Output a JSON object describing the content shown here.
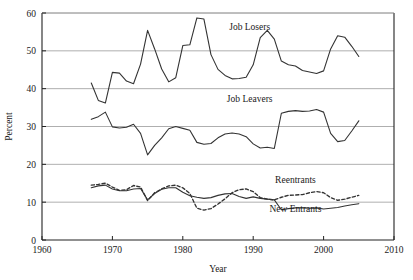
{
  "chart_data": {
    "type": "line",
    "title": "",
    "xlabel": "Year",
    "ylabel": "Percent",
    "xlim": [
      1960,
      2010
    ],
    "ylim": [
      0,
      60
    ],
    "xticks": [
      1960,
      1970,
      1980,
      1990,
      2000,
      2010
    ],
    "yticks": [
      0,
      10,
      20,
      30,
      40,
      50,
      60
    ],
    "grid": "horizontal",
    "legend_position": "inline-annotations",
    "colors": {
      "line": "#333333",
      "grid": "#9a9a9a",
      "axis": "#222222"
    },
    "series": [
      {
        "name": "Job Losers",
        "style": "solid",
        "label_x": 1989.5,
        "label_y": 55.5,
        "x": [
          1967,
          1968,
          1969,
          1970,
          1971,
          1972,
          1973,
          1974,
          1975,
          1976,
          1977,
          1978,
          1979,
          1980,
          1981,
          1982,
          1983,
          1984,
          1985,
          1986,
          1987,
          1988,
          1989,
          1990,
          1991,
          1992,
          1993,
          1994,
          1995,
          1996,
          1997,
          1998,
          1999,
          2000,
          2001,
          2002,
          2003,
          2004,
          2005
        ],
        "y": [
          41.5,
          36.9,
          36.2,
          44.3,
          44.1,
          42.0,
          41.3,
          46.5,
          55.4,
          50.5,
          45.2,
          41.8,
          42.9,
          51.4,
          51.6,
          58.7,
          58.4,
          49.0,
          45.1,
          43.5,
          42.6,
          42.7,
          43.0,
          46.3,
          53.5,
          55.4,
          53.1,
          47.3,
          46.3,
          46.0,
          44.8,
          44.4,
          44.0,
          44.7,
          50.5,
          54.0,
          53.6,
          51.2,
          48.5
        ]
      },
      {
        "name": "Job Leavers",
        "style": "solid",
        "label_x": 1989.5,
        "label_y": 36.5,
        "x": [
          1967,
          1968,
          1969,
          1970,
          1971,
          1972,
          1973,
          1974,
          1975,
          1976,
          1977,
          1978,
          1979,
          1980,
          1981,
          1982,
          1983,
          1984,
          1985,
          1986,
          1987,
          1988,
          1989,
          1990,
          1991,
          1992,
          1993,
          1994,
          1995,
          1996,
          1997,
          1998,
          1999,
          2000,
          2001,
          2002,
          2003,
          2004,
          2005
        ],
        "y": [
          31.9,
          32.6,
          33.8,
          29.9,
          29.6,
          29.8,
          30.6,
          28.2,
          22.5,
          25.0,
          27.0,
          29.4,
          30.0,
          29.5,
          29.0,
          25.8,
          25.3,
          25.5,
          27.0,
          28.0,
          28.3,
          28.0,
          27.3,
          25.4,
          24.3,
          24.5,
          24.2,
          33.5,
          34.0,
          34.2,
          34.0,
          34.1,
          34.5,
          33.8,
          28.2,
          26.0,
          26.3,
          28.8,
          31.5
        ]
      },
      {
        "name": "Reentrants",
        "style": "dashed",
        "label_x": 1996.0,
        "label_y": 15.0,
        "x": [
          1967,
          1968,
          1969,
          1970,
          1971,
          1972,
          1973,
          1974,
          1975,
          1976,
          1977,
          1978,
          1979,
          1980,
          1981,
          1982,
          1983,
          1984,
          1985,
          1986,
          1987,
          1988,
          1989,
          1990,
          1991,
          1992,
          1993,
          1994,
          1995,
          1996,
          1997,
          1998,
          1999,
          2000,
          2001,
          2002,
          2003,
          2004,
          2005
        ],
        "y": [
          14.5,
          14.7,
          15.0,
          14.0,
          13.1,
          13.3,
          14.4,
          14.0,
          10.4,
          12.5,
          13.5,
          14.3,
          14.5,
          13.8,
          12.3,
          8.4,
          7.9,
          8.3,
          9.5,
          10.9,
          12.5,
          13.3,
          13.5,
          12.8,
          11.2,
          10.8,
          10.6,
          11.3,
          11.8,
          11.9,
          12.0,
          12.5,
          12.8,
          12.5,
          11.2,
          10.5,
          10.8,
          11.3,
          11.8
        ]
      },
      {
        "name": "New Entrants",
        "style": "solid",
        "label_x": 1996.0,
        "label_y": 7.5,
        "x": [
          1967,
          1968,
          1969,
          1970,
          1971,
          1972,
          1973,
          1974,
          1975,
          1976,
          1977,
          1978,
          1979,
          1980,
          1981,
          1982,
          1983,
          1984,
          1985,
          1986,
          1987,
          1988,
          1989,
          1990,
          1991,
          1992,
          1993,
          1994,
          1995,
          1996,
          1997,
          1998,
          1999,
          2000,
          2001,
          2002,
          2003,
          2004,
          2005
        ],
        "y": [
          13.8,
          14.3,
          14.5,
          13.5,
          13.0,
          13.0,
          13.5,
          13.6,
          10.6,
          12.3,
          13.4,
          13.8,
          13.8,
          12.6,
          11.7,
          11.3,
          11.0,
          11.2,
          11.8,
          12.2,
          12.3,
          11.5,
          11.0,
          11.4,
          11.0,
          10.8,
          10.6,
          8.0,
          8.3,
          8.5,
          8.5,
          8.4,
          8.5,
          8.2,
          8.4,
          8.6,
          9.0,
          9.3,
          9.6
        ]
      }
    ]
  }
}
